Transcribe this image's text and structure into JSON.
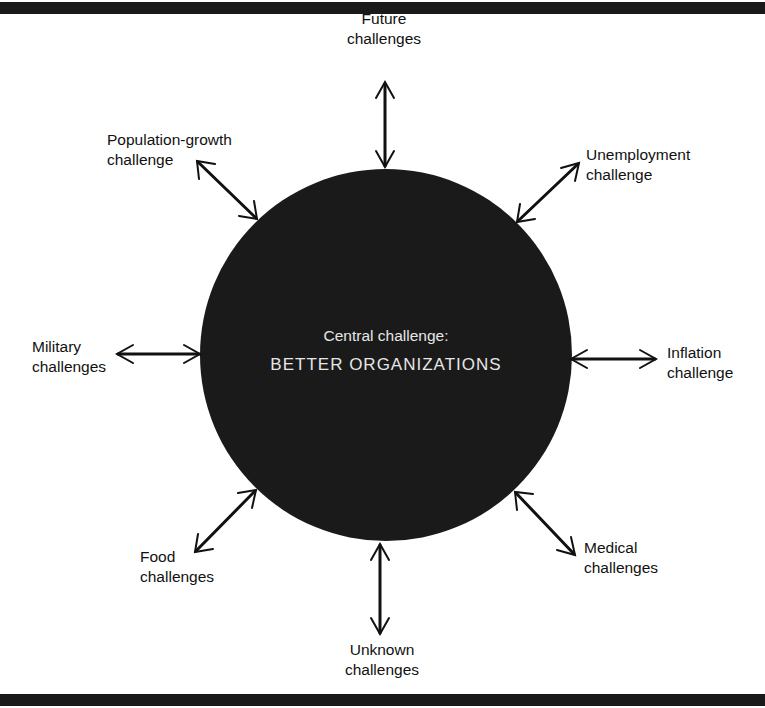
{
  "diagram": {
    "type": "hub-and-spoke",
    "center": {
      "subtitle": "Central challenge:",
      "title": "BETTER ORGANIZATIONS",
      "fill_color": "#1a1a1a",
      "text_color": "#e6e6e6"
    },
    "spokes": [
      {
        "id": "future",
        "line1": "Future",
        "line2": "challenges",
        "direction": "top"
      },
      {
        "id": "unemployment",
        "line1": "Unemployment",
        "line2": "challenge",
        "direction": "top-right"
      },
      {
        "id": "inflation",
        "line1": "Inflation",
        "line2": "challenge",
        "direction": "right"
      },
      {
        "id": "medical",
        "line1": "Medical",
        "line2": "challenges",
        "direction": "bottom-right"
      },
      {
        "id": "unknown",
        "line1": "Unknown",
        "line2": "challenges",
        "direction": "bottom"
      },
      {
        "id": "food",
        "line1": "Food",
        "line2": "challenges",
        "direction": "bottom-left"
      },
      {
        "id": "military",
        "line1": "Military",
        "line2": "challenges",
        "direction": "left"
      },
      {
        "id": "population",
        "line1": "Population-growth",
        "line2": "challenge",
        "direction": "top-left"
      }
    ],
    "arrow_style": "double-headed",
    "rule_color": "#1a1a1a"
  }
}
